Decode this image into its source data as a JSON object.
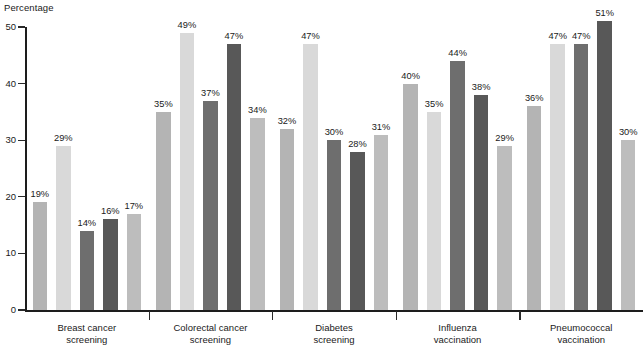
{
  "chart_data": {
    "type": "bar",
    "title": "",
    "subtitle": "",
    "xlabel": "",
    "ylabel": "Percentage",
    "ylim": [
      0,
      50
    ],
    "yticks": [
      0,
      10,
      20,
      30,
      40,
      50
    ],
    "grid": false,
    "legend": "none",
    "value_suffix": "%",
    "categories": [
      "Breast cancer screening",
      "Colorectal cancer screening",
      "Diabetes screening",
      "Influenza vaccination",
      "Pneumococcal vaccination"
    ],
    "category_lines": [
      [
        "Breast cancer",
        "screening"
      ],
      [
        "Colorectal cancer",
        "screening"
      ],
      [
        "Diabetes",
        "screening"
      ],
      [
        "Influenza",
        "vaccination"
      ],
      [
        "Pneumococcal",
        "vaccination"
      ]
    ],
    "series": [
      {
        "name": "series-1",
        "color": "#b4b4b4",
        "values": [
          19,
          35,
          32,
          40,
          36
        ],
        "labels": [
          "19%",
          "35%",
          "32%",
          "40%",
          "36%"
        ]
      },
      {
        "name": "series-2",
        "color": "#d9d9d9",
        "values": [
          29,
          49,
          47,
          35,
          47
        ],
        "labels": [
          "29%",
          "49%",
          "47%",
          "35%",
          "47%"
        ]
      },
      {
        "name": "series-3",
        "color": "#6e6e6e",
        "values": [
          14,
          37,
          30,
          44,
          47
        ],
        "labels": [
          "14%",
          "37%",
          "30%",
          "44%",
          "47%"
        ]
      },
      {
        "name": "series-4",
        "color": "#585858",
        "values": [
          16,
          47,
          28,
          38,
          51
        ],
        "labels": [
          "16%",
          "47%",
          "28%",
          "38%",
          "51%"
        ]
      },
      {
        "name": "series-5",
        "color": "#bdbdbd",
        "values": [
          17,
          34,
          31,
          29,
          30
        ],
        "labels": [
          "17%",
          "34%",
          "31%",
          "29%",
          "30%"
        ]
      }
    ]
  },
  "axis": {
    "y_title": "Percentage",
    "tick_labels": [
      "0",
      "10",
      "20",
      "30",
      "40",
      "50"
    ]
  }
}
